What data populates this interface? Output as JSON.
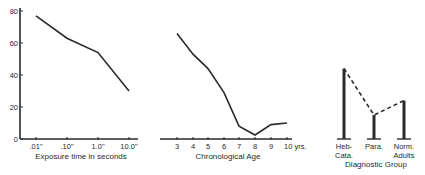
{
  "chart_data": [
    {
      "type": "line",
      "title": "",
      "xlabel": "Exposure time in seconds",
      "ylabel": "",
      "ylim": [
        0,
        80
      ],
      "yticks": [
        "0",
        "20",
        "40",
        "60",
        "80"
      ],
      "categories": [
        ".01\"",
        ".10\"",
        "1.0\"",
        "10.0\""
      ],
      "values": [
        77,
        63,
        54,
        30
      ],
      "grid": false
    },
    {
      "type": "line",
      "title": "",
      "xlabel": "Chronological Age",
      "ylabel": "",
      "ylim": [
        0,
        80
      ],
      "categories": [
        "3",
        "4",
        "5",
        "6",
        "7",
        "8",
        "9",
        "10 yrs."
      ],
      "values": [
        66,
        53,
        44,
        29,
        8,
        2.5,
        9,
        10
      ],
      "grid": false
    },
    {
      "type": "bar",
      "title": "",
      "xlabel": "Diagnostic Group",
      "ylabel": "",
      "ylim": [
        0,
        80
      ],
      "categories": [
        "Heb-Cata.",
        "Para.",
        "Norm. Adults"
      ],
      "category_lines": [
        [
          "Heb-",
          "Cata."
        ],
        [
          "Para."
        ],
        [
          "Norm.",
          "Adults"
        ]
      ],
      "values": [
        44,
        15,
        24
      ],
      "connector": "dashed",
      "grid": false
    }
  ],
  "colors": {
    "ink": "#2a2a2a",
    "background": "#ffffff"
  }
}
